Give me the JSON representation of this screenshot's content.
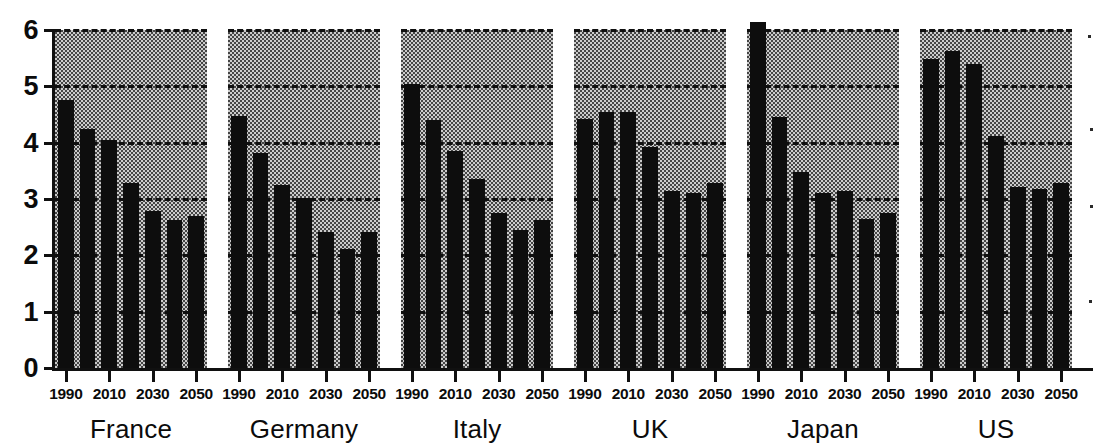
{
  "chart_data": {
    "type": "bar",
    "title": "",
    "xlabel": "",
    "ylabel": "",
    "ylim": [
      0,
      6
    ],
    "yticks": [
      0,
      1,
      2,
      3,
      4,
      5,
      6
    ],
    "ytick_labels": [
      "0",
      "1",
      "2",
      "3",
      "4",
      "5",
      "6"
    ],
    "grid": true,
    "grid_style": "dashed horizontal gridlines at 1,2,3,4,5,6",
    "legend": "none",
    "x": [
      1990,
      2000,
      2010,
      2020,
      2030,
      2040,
      2050
    ],
    "xtick_labels": [
      "1990",
      "2010",
      "2030",
      "2050"
    ],
    "xtick_values": [
      1990,
      2010,
      2030,
      2050
    ],
    "panels": [
      {
        "name": "France",
        "values": [
          4.75,
          4.25,
          4.05,
          3.28,
          2.78,
          2.62,
          2.7
        ]
      },
      {
        "name": "Germany",
        "values": [
          4.48,
          3.82,
          3.25,
          3.02,
          2.42,
          2.12,
          2.42
        ]
      },
      {
        "name": "Italy",
        "values": [
          5.05,
          4.4,
          3.85,
          3.35,
          2.75,
          2.45,
          2.62
        ]
      },
      {
        "name": "UK",
        "values": [
          4.42,
          4.55,
          4.55,
          3.92,
          3.15,
          3.1,
          3.28
        ]
      },
      {
        "name": "Japan",
        "values": [
          6.15,
          4.45,
          3.48,
          3.1,
          3.15,
          2.65,
          2.75
        ]
      },
      {
        "name": "US",
        "values": [
          5.48,
          5.62,
          5.4,
          4.12,
          3.22,
          3.18,
          3.28
        ]
      }
    ]
  },
  "axes": {
    "y_labels": [
      "6",
      "5",
      "4",
      "3",
      "2",
      "1",
      "0"
    ],
    "panel_names": [
      "France",
      "Germany",
      "Italy",
      "UK",
      "Japan",
      "US"
    ],
    "x_labels_per_panel": [
      "1990",
      "2010",
      "2030",
      "2050"
    ]
  }
}
